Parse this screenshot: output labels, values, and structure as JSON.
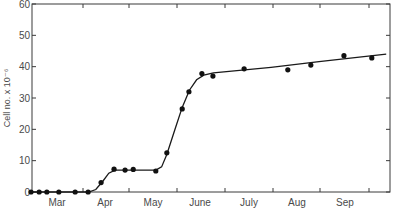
{
  "chart_data": {
    "type": "scatter",
    "title": "",
    "xlabel": "",
    "ylabel": "Cell no. x 10⁻⁶",
    "ylim": [
      0,
      60
    ],
    "yticks": [
      "0",
      "10",
      "20",
      "30",
      "40",
      "50",
      "60"
    ],
    "xticks": [
      "Mar",
      "Apr",
      "May",
      "June",
      "July",
      "Aug",
      "Sep"
    ],
    "grid": false,
    "legend": null,
    "series": [
      {
        "name": "Cell number",
        "style": "points with fitted smooth curve",
        "points": [
          {
            "month_pos": 0.0,
            "y": 0
          },
          {
            "month_pos": 0.17,
            "y": 0
          },
          {
            "month_pos": 0.33,
            "y": 0
          },
          {
            "month_pos": 0.58,
            "y": 0
          },
          {
            "month_pos": 0.92,
            "y": 0
          },
          {
            "month_pos": 1.19,
            "y": 0
          },
          {
            "month_pos": 1.46,
            "y": 3
          },
          {
            "month_pos": 1.73,
            "y": 7.3
          },
          {
            "month_pos": 1.96,
            "y": 7
          },
          {
            "month_pos": 2.13,
            "y": 7.2
          },
          {
            "month_pos": 2.6,
            "y": 6.7
          },
          {
            "month_pos": 2.83,
            "y": 12.5
          },
          {
            "month_pos": 3.15,
            "y": 26.5
          },
          {
            "month_pos": 3.29,
            "y": 32
          },
          {
            "month_pos": 3.56,
            "y": 37.8
          },
          {
            "month_pos": 3.79,
            "y": 37
          },
          {
            "month_pos": 4.44,
            "y": 39.3
          },
          {
            "month_pos": 5.35,
            "y": 39
          },
          {
            "month_pos": 5.83,
            "y": 40.5
          },
          {
            "month_pos": 6.52,
            "y": 43.5
          },
          {
            "month_pos": 7.1,
            "y": 42.8
          }
        ]
      }
    ]
  }
}
